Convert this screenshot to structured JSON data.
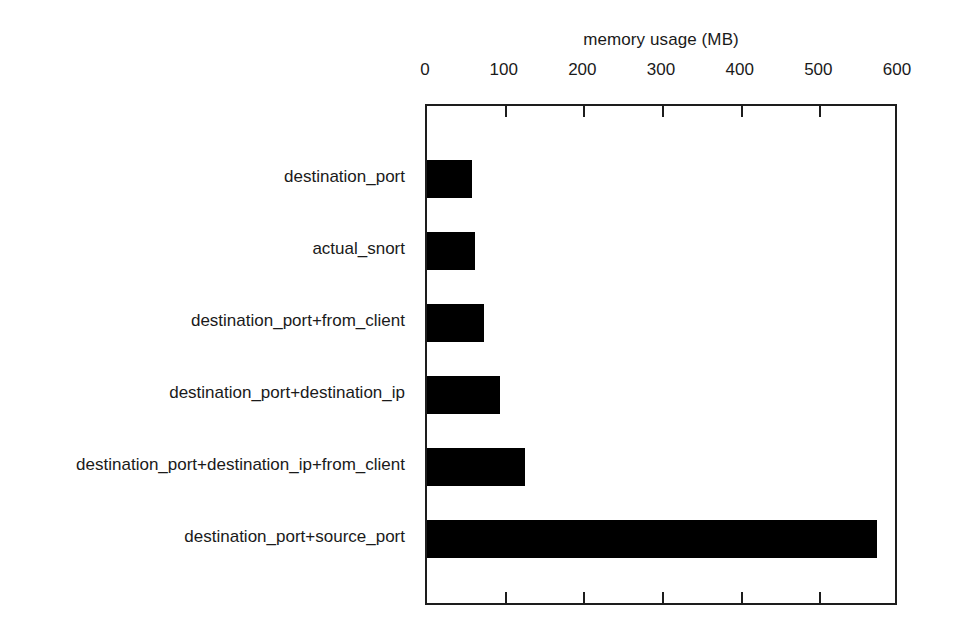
{
  "chart_data": {
    "type": "bar",
    "orientation": "horizontal",
    "title": "memory usage (MB)",
    "xlabel": "memory usage (MB)",
    "ylabel": "",
    "xlim": [
      0,
      600
    ],
    "ylim": null,
    "grid": false,
    "legend": null,
    "xticks": [
      0,
      100,
      200,
      300,
      400,
      500,
      600
    ],
    "xtick_labels": [
      "0",
      "100",
      "200",
      "300",
      "400",
      "500",
      "600"
    ],
    "bar_color": "#000000",
    "axis_color": "#1d1d1d",
    "background": "#ffffff",
    "categories": [
      "destination_port",
      "actual_snort",
      "destination_port+from_client",
      "destination_port+destination_ip",
      "destination_port+destination_ip+from_client",
      "destination_port+source_port"
    ],
    "values": [
      57,
      61,
      72,
      93,
      124,
      572
    ],
    "series": [
      {
        "name": "memory usage (MB)",
        "values": [
          57,
          61,
          72,
          93,
          124,
          572
        ]
      }
    ]
  }
}
